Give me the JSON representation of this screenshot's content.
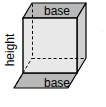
{
  "figure": {
    "name": "rectangular-prism-diagram",
    "labels": {
      "base_top": "base",
      "base_bottom": "base",
      "height": "height"
    },
    "colors": {
      "background": "#ffffff",
      "front_face": "#e8e8e8",
      "top_face": "#b9b9b9",
      "bottom_face": "#b9b9b9",
      "right_face": "#d0d0d0",
      "edge_stroke": "#000000",
      "hidden_edge_stroke": "#000000",
      "text": "#000000"
    },
    "geometry": {
      "front_top_left": [
        23,
        18
      ],
      "front_top_right": [
        77,
        18
      ],
      "front_bottom_left": [
        23,
        73
      ],
      "front_bottom_right": [
        77,
        73
      ],
      "back_top_left": [
        32,
        3
      ],
      "back_top_right": [
        86,
        3
      ],
      "back_bottom_left": [
        32,
        58
      ],
      "back_bottom_right": [
        86,
        58
      ],
      "bottom_face_front_left": [
        14,
        88
      ],
      "bottom_face_front_right": [
        68,
        88
      ]
    },
    "edge_margin_fragment": "·"
  }
}
